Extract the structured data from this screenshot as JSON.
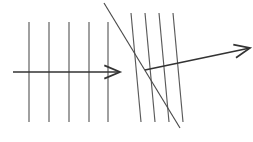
{
  "figure": {
    "background_color": "#ffffff",
    "width": 253,
    "height": 142
  },
  "colors": {
    "wavefront": "#5a5a5a",
    "interface": "#4a4a4a",
    "ray": "#333333"
  },
  "chart_data": {
    "type": "line",
    "subtitle": "",
    "xlabel": "",
    "ylabel": "",
    "xlim": [
      0,
      253
    ],
    "ylim": [
      142,
      0
    ],
    "grid": false,
    "legend": false,
    "annotations": [],
    "series": [
      {
        "name": "incident-wavefront-1",
        "kind": "wavefront",
        "x": [
          29,
          29
        ],
        "y": [
          22,
          122
        ]
      },
      {
        "name": "incident-wavefront-2",
        "kind": "wavefront",
        "x": [
          49,
          49
        ],
        "y": [
          22,
          122
        ]
      },
      {
        "name": "incident-wavefront-3",
        "kind": "wavefront",
        "x": [
          69,
          69
        ],
        "y": [
          22,
          122
        ]
      },
      {
        "name": "incident-wavefront-4",
        "kind": "wavefront",
        "x": [
          89,
          89
        ],
        "y": [
          22,
          122
        ]
      },
      {
        "name": "incident-wavefront-5",
        "kind": "wavefront",
        "x": [
          108,
          108
        ],
        "y": [
          22,
          122
        ]
      },
      {
        "name": "refracted-wavefront-1",
        "kind": "wavefront",
        "x": [
          131,
          141
        ],
        "y": [
          13,
          122
        ]
      },
      {
        "name": "refracted-wavefront-2",
        "kind": "wavefront",
        "x": [
          145,
          155
        ],
        "y": [
          13,
          122
        ]
      },
      {
        "name": "refracted-wavefront-3",
        "kind": "wavefront",
        "x": [
          159,
          169
        ],
        "y": [
          13,
          122
        ]
      },
      {
        "name": "refracted-wavefront-4",
        "kind": "wavefront",
        "x": [
          173,
          183
        ],
        "y": [
          13,
          122
        ]
      },
      {
        "name": "interface",
        "kind": "boundary",
        "x": [
          104,
          180
        ],
        "y": [
          3,
          128
        ]
      },
      {
        "name": "incident-ray",
        "kind": "ray",
        "x": [
          13,
          120
        ],
        "y": [
          72,
          72
        ],
        "arrow": "end"
      },
      {
        "name": "refracted-ray",
        "kind": "ray",
        "x": [
          145,
          250
        ],
        "y": [
          70,
          48
        ],
        "arrow": "end"
      }
    ]
  },
  "elements": {
    "incident_wavefronts_label": "Incident wavefronts",
    "refracted_wavefronts_label": "Refracted wavefronts",
    "interface_label": "Interface",
    "incident_ray_label": "Incident ray",
    "refracted_ray_label": "Refracted ray"
  }
}
